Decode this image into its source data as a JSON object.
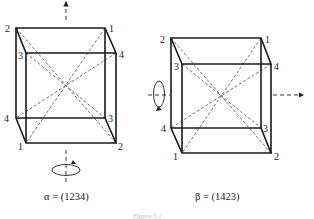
{
  "figures": [
    {
      "id": "alpha",
      "caption": "α = (1234)",
      "rotation_axis": "vertical",
      "vertex_labels": {
        "back_top_left": "2",
        "back_top_right": "1",
        "front_top_left": "3",
        "front_top_right": "4",
        "back_bottom_left": "4",
        "back_bottom_right": "3",
        "front_bottom_left": "1",
        "front_bottom_right": "2"
      }
    },
    {
      "id": "beta",
      "caption": "β = (1423)",
      "rotation_axis": "horizontal",
      "vertex_labels": {
        "back_top_left": "2",
        "back_top_right": "1",
        "front_top_left": "3",
        "front_top_right": "4",
        "back_bottom_left": "4",
        "back_bottom_right": "3",
        "front_bottom_left": "1",
        "front_bottom_right": "2"
      }
    }
  ],
  "figure_caption": "Figure 5.1"
}
